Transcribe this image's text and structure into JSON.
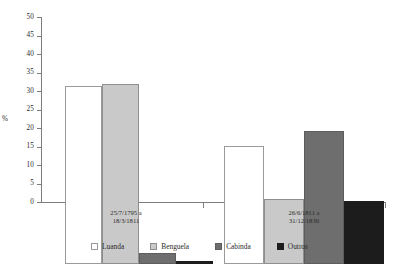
{
  "chart_data": {
    "type": "bar",
    "title": "",
    "subtitle": "",
    "xlabel": "",
    "ylabel": "%",
    "ylim": [
      0,
      50
    ],
    "ytick_step": 5,
    "ytick_labels": [
      "0",
      "5",
      "10",
      "15",
      "20",
      "25",
      "30",
      "35",
      "40",
      "45",
      "50"
    ],
    "grid": false,
    "legend_position": "bottom",
    "categories": [
      "25/7/1795 a\n18/3/1811",
      "26/6/1811 a\n31/12/1830"
    ],
    "category_lines": [
      [
        "25/7/1795 a",
        "18/3/1811"
      ],
      [
        "26/6/1811 a",
        "31/12/1830"
      ]
    ],
    "series": [
      {
        "name": "Luanda",
        "color": "#ffffff",
        "values": [
          48.0,
          32.0
        ]
      },
      {
        "name": "Benguela",
        "color": "#c9c9c9",
        "values": [
          48.7,
          17.5
        ]
      },
      {
        "name": "Cabinda",
        "color": "#6e6e6e",
        "values": [
          3.0,
          36.0
        ]
      },
      {
        "name": "Outros",
        "color": "#1c1c1c",
        "values": [
          0.7,
          17.0
        ]
      }
    ]
  },
  "axis": {
    "y_title": "%",
    "ticks": [
      {
        "label": "50",
        "value": 50
      },
      {
        "label": "45",
        "value": 45
      },
      {
        "label": "40",
        "value": 40
      },
      {
        "label": "35",
        "value": 35
      },
      {
        "label": "30",
        "value": 30
      },
      {
        "label": "25",
        "value": 25
      },
      {
        "label": "20",
        "value": 20
      },
      {
        "label": "15",
        "value": 15
      },
      {
        "label": "10",
        "value": 10
      },
      {
        "label": "5",
        "value": 5
      },
      {
        "label": "0",
        "value": 0
      }
    ]
  },
  "groups": [
    {
      "line1": "25/7/1795 a",
      "line2": "18/3/1811",
      "bars": [
        {
          "series": "Luanda",
          "value": 48.0
        },
        {
          "series": "Benguela",
          "value": 48.7
        },
        {
          "series": "Cabinda",
          "value": 3.0
        },
        {
          "series": "Outros",
          "value": 0.7
        }
      ]
    },
    {
      "line1": "26/6/1811 a",
      "line2": "31/12/1830",
      "bars": [
        {
          "series": "Luanda",
          "value": 32.0
        },
        {
          "series": "Benguela",
          "value": 17.5
        },
        {
          "series": "Cabinda",
          "value": 36.0
        },
        {
          "series": "Outros",
          "value": 17.0
        }
      ]
    }
  ],
  "legend": {
    "items": [
      {
        "label": "Luanda",
        "swatch": "luanda-swatch"
      },
      {
        "label": "Benguela",
        "swatch": "benguela-swatch"
      },
      {
        "label": "Cabinda",
        "swatch": "cabinda-swatch"
      },
      {
        "label": "Outros",
        "swatch": "outros-swatch"
      }
    ]
  }
}
